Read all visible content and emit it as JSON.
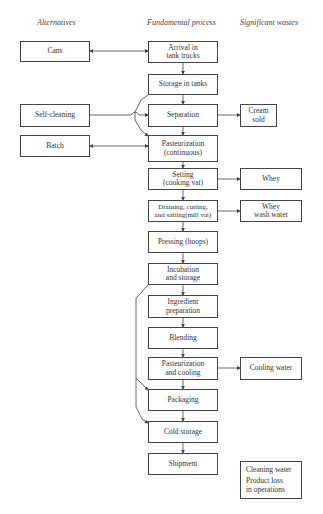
{
  "headers": {
    "alternatives": "Alternatives",
    "fundamental": "Fundamental process",
    "wastes": "Significant wastes"
  },
  "process": [
    {
      "id": "arrival",
      "label": "Arrival in\ntank trucks"
    },
    {
      "id": "storage",
      "label": "Storage in tanks"
    },
    {
      "id": "separation",
      "label": "Separation"
    },
    {
      "id": "pasteurization",
      "label": "Pasteurization\n(continuous)"
    },
    {
      "id": "setting",
      "label": "Setting\n(cooking vat)"
    },
    {
      "id": "draining",
      "label": "Draining, cutting,\nand salting(mill vat)"
    },
    {
      "id": "pressing",
      "label": "Pressing (hoops)"
    },
    {
      "id": "incubation",
      "label": "Incubation\nand storage"
    },
    {
      "id": "ingredient",
      "label": "Ingredient\npreparation"
    },
    {
      "id": "blending",
      "label": "Blending"
    },
    {
      "id": "past_cooling",
      "label": "Pasteurization\nand cooling"
    },
    {
      "id": "packaging",
      "label": "Packaging"
    },
    {
      "id": "cold_storage",
      "label": "Cold storage"
    },
    {
      "id": "shipment",
      "label": "Shipment"
    }
  ],
  "alternatives": [
    {
      "id": "cans",
      "label": "Cans"
    },
    {
      "id": "self_cleaning",
      "label": "Self-cleaning"
    },
    {
      "id": "batch",
      "label": "Batch"
    }
  ],
  "wastes": [
    {
      "id": "cream",
      "label": "Cream\nsold"
    },
    {
      "id": "whey",
      "label": "Whey"
    },
    {
      "id": "whey_wash",
      "label": "Whey\nwash water"
    },
    {
      "id": "cooling_water",
      "label": "Cooling water"
    },
    {
      "id": "general_1",
      "label": "Cleaning water"
    },
    {
      "id": "general_2",
      "label": "Product loss\nin operations"
    }
  ]
}
